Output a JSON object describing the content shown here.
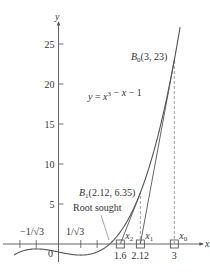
{
  "chart_data": {
    "type": "line",
    "title": "",
    "xlabel": "x",
    "ylabel": "y",
    "function_label": "y = x³ − x − 1",
    "function": "x^3 - x - 1",
    "x_domain_plotted": [
      -1.15,
      3.15
    ],
    "xlim": [
      -1.5,
      3.9
    ],
    "ylim": [
      -3,
      27
    ],
    "grid": false,
    "y_ticks": [
      5,
      10,
      15,
      20,
      25
    ],
    "y_tick_labels": [
      "5",
      "10",
      "15",
      "20",
      "25"
    ],
    "x_ticks": [
      -1,
      -0.577,
      0.577,
      1
    ],
    "x_tick_labels_above": [
      {
        "x": -0.577,
        "label": "−1/√3"
      },
      {
        "x": 0.577,
        "label": "1/√3"
      }
    ],
    "origin_label": "0",
    "x_marked_points": [
      {
        "x": 1.6,
        "label_below": "1.6",
        "label_above": "x2",
        "subscript": "2"
      },
      {
        "x": 2.12,
        "label_below": "2.12",
        "label_above": "x1",
        "subscript": "1"
      },
      {
        "x": 3,
        "label_below": "3",
        "label_above": "x0",
        "subscript": "0"
      }
    ],
    "points": [
      {
        "name": "B0",
        "x": 3,
        "y": 23,
        "label": "(3, 23)"
      },
      {
        "name": "B1",
        "x": 2.12,
        "y": 6.35,
        "label": "(2.12, 6.35)"
      }
    ],
    "secant_lines": [
      {
        "from": [
          3,
          23
        ],
        "to": [
          2.12,
          0
        ]
      },
      {
        "from": [
          2.12,
          6.35
        ],
        "to": [
          1.6,
          0
        ]
      }
    ],
    "dashed_verticals": [
      {
        "x": 3,
        "from_y": 0,
        "to_y": 23
      },
      {
        "x": 2.12,
        "from_y": 0,
        "to_y": 6.35
      }
    ],
    "annotations": [
      {
        "text": "Root sought",
        "points_to_x": 1.3247
      }
    ]
  },
  "style": {
    "curve_color": "#555555",
    "axis_color": "#555555",
    "text_color": "#333333"
  }
}
